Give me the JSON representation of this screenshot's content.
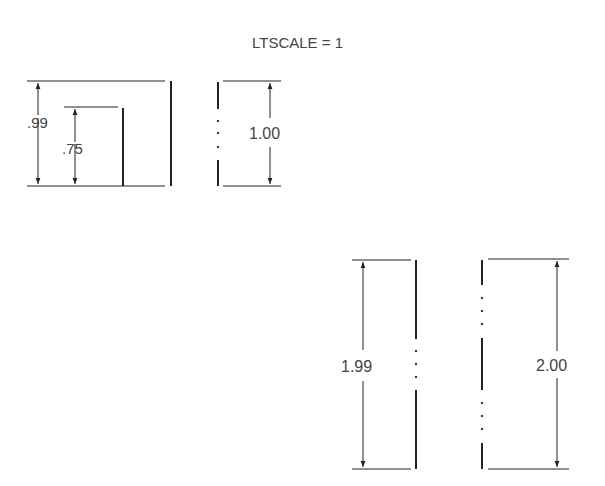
{
  "title": "LTSCALE  =  1",
  "colors": {
    "line": "#222222",
    "text": "#444444",
    "background": "#ffffff"
  },
  "figures": [
    {
      "id": "fig1",
      "dims": [
        ".99",
        ".75"
      ]
    },
    {
      "id": "fig2",
      "dims": [
        "1.00"
      ]
    },
    {
      "id": "fig3",
      "dims": [
        "1.99"
      ]
    },
    {
      "id": "fig4",
      "dims": [
        "2.00"
      ]
    }
  ]
}
